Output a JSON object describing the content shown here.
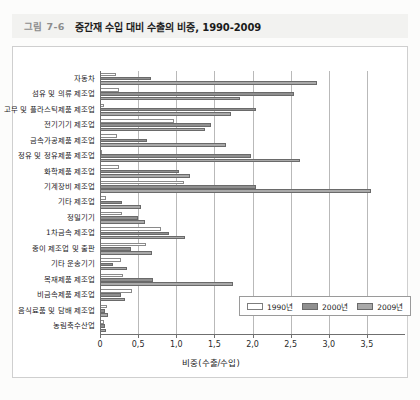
{
  "caption": {
    "figure_number": "그림 7-6",
    "title": "중간재 수입 대비 수출의 비중, 1990-2009"
  },
  "chart_data": {
    "type": "bar",
    "orientation": "horizontal",
    "title": "중간재 수입 대비 수출의 비중, 1990-2009",
    "xlabel": "비중(수출/수입)",
    "ylabel": "",
    "xlim": [
      0,
      4.0
    ],
    "xticks": [
      "0",
      "0,5",
      "1,0",
      "1,5",
      "2,0",
      "2,5",
      "3,0",
      "3,5"
    ],
    "xtick_values": [
      0,
      0.5,
      1.0,
      1.5,
      2.0,
      2.5,
      3.0,
      3.5
    ],
    "grid": true,
    "legend_position": "bottom-right",
    "categories": [
      "자동차",
      "섬유 및 의류 제조업",
      "고무 및 플라스틱제품 제조업",
      "전기기기 제조업",
      "금속가공제품 제조업",
      "정유 및 정유제품 제조업",
      "화학제품 제조업",
      "기계장비 제조업",
      "기타 제조업",
      "정밀기기",
      "1차금속 제조업",
      "종이 제조업 및 출판",
      "기타 운송기기",
      "목재제품 제조업",
      "비금속제품 제조업",
      "음식료품 및 담배 제조업",
      "농림축수산업"
    ],
    "series": [
      {
        "name": "1990년",
        "color": "#ffffff",
        "values": [
          0.21,
          0.25,
          0.05,
          0.97,
          0.22,
          0.03,
          0.25,
          1.1,
          0.08,
          0.29,
          0.8,
          0.6,
          0.28,
          0.3,
          0.42,
          0.09,
          0.05
        ]
      },
      {
        "name": "2000년",
        "color": "#8f8f8f",
        "values": [
          0.67,
          2.54,
          2.05,
          1.46,
          0.62,
          1.98,
          1.04,
          2.05,
          0.29,
          0.5,
          0.91,
          0.4,
          0.17,
          0.7,
          0.27,
          0.07,
          0.06
        ]
      },
      {
        "name": "2009년",
        "color": "#a9a9a9",
        "values": [
          2.85,
          1.83,
          1.72,
          1.38,
          1.65,
          2.62,
          1.18,
          3.55,
          0.54,
          0.59,
          1.11,
          0.68,
          0.35,
          1.75,
          0.33,
          0.1,
          0.08
        ]
      }
    ]
  },
  "legend": {
    "items": [
      {
        "label": "1990년",
        "key": "s1990"
      },
      {
        "label": "2000년",
        "key": "s2000"
      },
      {
        "label": "2009년",
        "key": "s2009"
      }
    ]
  }
}
